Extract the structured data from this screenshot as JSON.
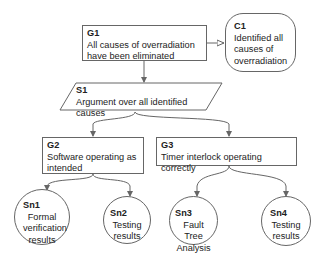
{
  "diagram": {
    "type": "Goal Structuring Notation",
    "nodes": {
      "G1": {
        "id": "G1",
        "kind": "goal",
        "text": "All causes of overradiation have been eliminated"
      },
      "C1": {
        "id": "C1",
        "kind": "context",
        "text": "Identified all causes of overradiation"
      },
      "S1": {
        "id": "S1",
        "kind": "strategy",
        "text": "Argument over all identified causes"
      },
      "G2": {
        "id": "G2",
        "kind": "goal",
        "text": "Software operating as intended"
      },
      "G3": {
        "id": "G3",
        "kind": "goal",
        "text": "Timer interlock operating correctly"
      },
      "Sn1": {
        "id": "Sn1",
        "kind": "solution",
        "text": "Formal verification results"
      },
      "Sn2": {
        "id": "Sn2",
        "kind": "solution",
        "text": "Testing results"
      },
      "Sn3": {
        "id": "Sn3",
        "kind": "solution",
        "text": "Fault Tree Analysis"
      },
      "Sn4": {
        "id": "Sn4",
        "kind": "solution",
        "text": "Testing results"
      }
    },
    "edges": [
      {
        "from": "G1",
        "to": "C1",
        "type": "in-context-of"
      },
      {
        "from": "G1",
        "to": "S1",
        "type": "supported-by"
      },
      {
        "from": "S1",
        "to": "G2",
        "type": "supported-by"
      },
      {
        "from": "S1",
        "to": "G3",
        "type": "supported-by"
      },
      {
        "from": "G2",
        "to": "Sn1",
        "type": "supported-by"
      },
      {
        "from": "G2",
        "to": "Sn2",
        "type": "supported-by"
      },
      {
        "from": "G3",
        "to": "Sn3",
        "type": "supported-by"
      },
      {
        "from": "G3",
        "to": "Sn4",
        "type": "supported-by"
      }
    ]
  }
}
